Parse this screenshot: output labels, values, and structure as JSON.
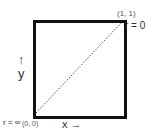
{
  "diagram": {
    "top_right_coord": "(1, 1)",
    "top_right_label": "r = 0",
    "bottom_left_label": "r = ∞",
    "bottom_left_coord": "(0, 0)",
    "y_arrow": "↑",
    "y_label": "y",
    "x_label": "x →"
  }
}
